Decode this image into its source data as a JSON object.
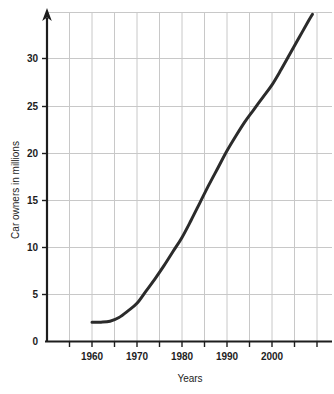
{
  "chart_data": {
    "type": "line",
    "title": "",
    "xlabel": "Years",
    "ylabel": "Car owners in millions",
    "xlim": [
      1950,
      2010
    ],
    "ylim": [
      0,
      35
    ],
    "xticks": [
      1960,
      1970,
      1980,
      1990,
      2000
    ],
    "xtick_labels": [
      "1960",
      "1970",
      "1980",
      "1990",
      "2000"
    ],
    "yticks": [
      0,
      5,
      10,
      15,
      20,
      25,
      30
    ],
    "ytick_labels": [
      "0",
      "5",
      "10",
      "15",
      "20",
      "25",
      "30"
    ],
    "grid": true,
    "grid_x_step": 5,
    "grid_y_step": 5,
    "legend": "none",
    "x": [
      1960,
      1962,
      1964,
      1966,
      1968,
      1970,
      1972,
      1974,
      1976,
      1978,
      1980,
      1982,
      1984,
      1986,
      1988,
      1990,
      1992,
      1994,
      1996,
      1998,
      2000,
      2002,
      2004,
      2006,
      2008,
      2009
    ],
    "values": [
      2.0,
      2.0,
      2.1,
      2.5,
      3.2,
      4.0,
      5.3,
      6.6,
      8.0,
      9.5,
      11.0,
      12.8,
      14.7,
      16.6,
      18.4,
      20.2,
      21.8,
      23.3,
      24.6,
      25.9,
      27.2,
      28.8,
      30.5,
      32.2,
      33.9,
      34.7
    ],
    "series": [
      {
        "name": "Car owners",
        "color": "#2b2b2b",
        "values": [
          2.0,
          2.0,
          2.1,
          2.5,
          3.2,
          4.0,
          5.3,
          6.6,
          8.0,
          9.5,
          11.0,
          12.8,
          14.7,
          16.6,
          18.4,
          20.2,
          21.8,
          23.3,
          24.6,
          25.9,
          27.2,
          28.8,
          30.5,
          32.2,
          33.9,
          34.7
        ]
      }
    ],
    "annotations": [],
    "colors": {
      "line": "#2b2b2b",
      "axis": "#1d1d1d",
      "grid": "#c8c8c8",
      "background": "#ffffff",
      "text": "#1d1d1d"
    },
    "axis_style": {
      "y_axis_arrow": true,
      "x_axis_arrow": false
    }
  }
}
